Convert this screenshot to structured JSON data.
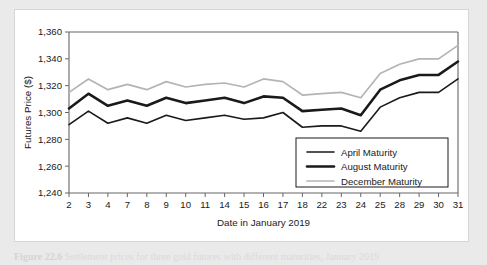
{
  "figure": {
    "panel_background": "#ffffff",
    "page_background": "#eaeaea",
    "caption_figure_label": "Figure 22.6",
    "caption_rest": "Settlement prices for three gold futures with different maturities, January 2019"
  },
  "chart_data": {
    "type": "line",
    "title": "",
    "xlabel": "Date in January 2019",
    "ylabel": "Futures Price ($)",
    "categories": [
      "2",
      "3",
      "4",
      "7",
      "8",
      "9",
      "10",
      "11",
      "14",
      "15",
      "16",
      "17",
      "18",
      "22",
      "23",
      "24",
      "25",
      "28",
      "29",
      "30",
      "31"
    ],
    "ylim": [
      1240,
      1360
    ],
    "yticks": [
      1240,
      1260,
      1280,
      1300,
      1320,
      1340,
      1360
    ],
    "ytick_labels": [
      "1,240",
      "1,260",
      "1,280",
      "1,300",
      "1,320",
      "1,340",
      "1,360"
    ],
    "grid": false,
    "legend_position": "lower-right",
    "series": [
      {
        "name": "April Maturity",
        "color": "#1a1a1a",
        "width": 1.6,
        "values": [
          1291,
          1301,
          1292,
          1296,
          1292,
          1298,
          1294,
          1296,
          1298,
          1295,
          1296,
          1300,
          1289,
          1290,
          1290,
          1286,
          1304,
          1311,
          1315,
          1315,
          1325
        ]
      },
      {
        "name": "August Maturity",
        "color": "#1a1a1a",
        "width": 2.6,
        "values": [
          1303,
          1314,
          1305,
          1309,
          1305,
          1311,
          1307,
          1309,
          1311,
          1307,
          1312,
          1311,
          1301,
          1302,
          1303,
          1298,
          1317,
          1324,
          1328,
          1328,
          1338
        ]
      },
      {
        "name": "December Maturity",
        "color": "#b4b4b4",
        "width": 1.7,
        "values": [
          1315,
          1325,
          1317,
          1321,
          1317,
          1323,
          1319,
          1321,
          1322,
          1319,
          1325,
          1323,
          1313,
          1314,
          1315,
          1311,
          1329,
          1336,
          1340,
          1340,
          1350
        ]
      }
    ]
  }
}
